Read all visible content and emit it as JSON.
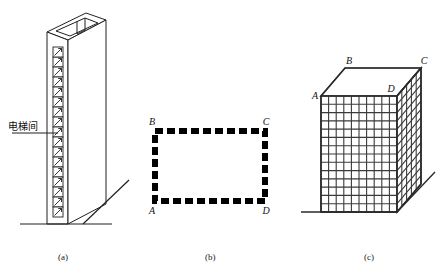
{
  "figure": {
    "background_color": "#ffffff",
    "stroke_color": "#231f20",
    "panels": [
      {
        "id": "a",
        "caption": "(a)",
        "type": "tower-elevation",
        "annotation_label": "电梯间",
        "annotation_meaning_icon": "leader-line",
        "elevator_door_count": 17,
        "ground_line": true
      },
      {
        "id": "b",
        "caption": "(b)",
        "type": "dashed-rectangle-plan",
        "corner_labels": {
          "top_left": "B",
          "top_right": "C",
          "bottom_left": "A",
          "bottom_right": "D"
        },
        "border_style": "thick-dashed",
        "dash_count_horizontal": 11,
        "dash_count_vertical": 6
      },
      {
        "id": "c",
        "caption": "(c)",
        "type": "gridded-box-3d",
        "corner_labels": {
          "top_back_left": "B",
          "top_back_right": "C",
          "top_front_left": "A",
          "top_front_right": "D"
        },
        "front_face_columns": 10,
        "front_face_rows": 14,
        "side_face_columns": 5,
        "ground_line": true
      }
    ]
  },
  "captions": {
    "a": "(a)",
    "b": "(b)",
    "c": "(c)"
  },
  "labels": {
    "elevator_room": "电梯间",
    "A": "A",
    "B": "B",
    "C": "C",
    "D": "D"
  }
}
